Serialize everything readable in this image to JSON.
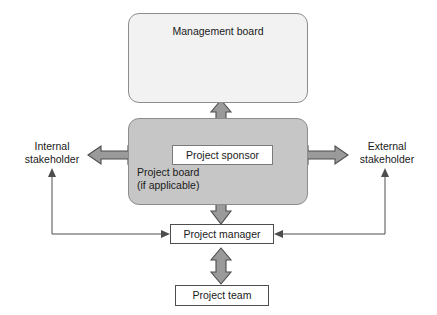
{
  "diagram": {
    "nodes": {
      "management_board": {
        "label": "Management board",
        "fill": "#f2f2f2",
        "shape": "rounded-rect"
      },
      "project_board": {
        "label_line1": "Project board",
        "label_line2": "(if applicable)",
        "fill": "#c6c6c6",
        "shape": "rounded-rect"
      },
      "project_sponsor": {
        "label": "Project sponsor",
        "fill": "#ffffff",
        "shape": "rect"
      },
      "project_manager": {
        "label": "Project manager",
        "fill": "#ffffff",
        "shape": "rect"
      },
      "project_team": {
        "label": "Project team",
        "fill": "#ffffff",
        "shape": "rect"
      },
      "internal_stakeholder": {
        "label_line1": "Internal",
        "label_line2": "stakeholder",
        "shape": "text"
      },
      "external_stakeholder": {
        "label_line1": "External",
        "label_line2": "stakeholder",
        "shape": "text"
      }
    },
    "connectors": [
      {
        "id": "mgmt-board-to-project-board",
        "from": "management_board",
        "to": "project_board",
        "style": "block-arrow",
        "direction": "bidirectional",
        "orientation": "vertical"
      },
      {
        "id": "project-board-to-internal-stakeholder",
        "from": "project_board",
        "to": "internal_stakeholder",
        "style": "block-arrow",
        "direction": "bidirectional",
        "orientation": "horizontal"
      },
      {
        "id": "project-board-to-external-stakeholder",
        "from": "project_board",
        "to": "external_stakeholder",
        "style": "block-arrow",
        "direction": "bidirectional",
        "orientation": "horizontal"
      },
      {
        "id": "project-sponsor-to-project-manager",
        "from": "project_sponsor",
        "to": "project_manager",
        "style": "block-arrow",
        "direction": "bidirectional",
        "orientation": "vertical"
      },
      {
        "id": "project-manager-to-project-team",
        "from": "project_manager",
        "to": "project_team",
        "style": "block-arrow",
        "direction": "bidirectional",
        "orientation": "vertical"
      },
      {
        "id": "project-manager-to-internal-stakeholder",
        "from": "project_manager",
        "to": "internal_stakeholder",
        "style": "thin-line",
        "direction": "bidirectional",
        "orientation": "elbow-left"
      },
      {
        "id": "project-manager-to-external-stakeholder",
        "from": "project_manager",
        "to": "external_stakeholder",
        "style": "thin-line",
        "direction": "bidirectional",
        "orientation": "elbow-right"
      }
    ],
    "colors": {
      "arrow_fill": "#9a9a9a",
      "arrow_stroke": "#4d4d4d",
      "line": "#4d4d4d",
      "board_grey": "#c6c6c6",
      "board_light": "#f2f2f2",
      "text": "#1a1a1a",
      "background": "#ffffff"
    }
  }
}
